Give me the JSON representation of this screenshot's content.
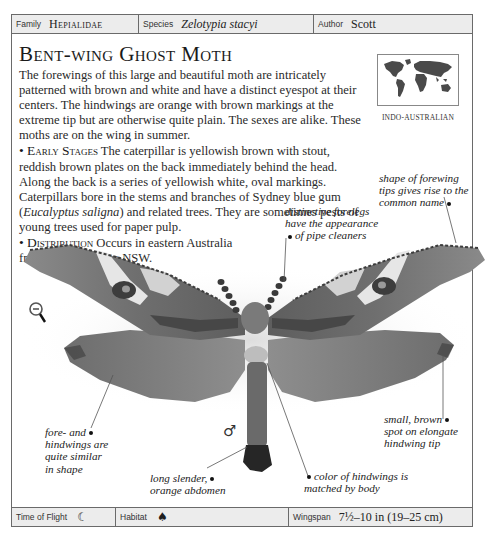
{
  "header": {
    "family_label": "Family",
    "family_value": "Hepialidae",
    "species_label": "Species",
    "species_value": "Zelotypia stacyi",
    "author_label": "Author",
    "author_value": "Scott"
  },
  "title": "Bent-wing Ghost Moth",
  "description": "The forewings of this large and beautiful moth are intricately patterned with brown and white and have a distinct eyespot at their centers. The hindwings are orange with brown markings at the extreme tip but are otherwise quite plain. The sexes are alike. These moths are on the wing in summer.",
  "early_stages": {
    "heading": "Early Stages",
    "text_before": "The caterpillar is yellowish brown with stout, reddish brown plates on the back immediately behind the head. Along the back is a series of yellowish white, oval markings. Caterpillars bore in the stems and branches of Sydney blue gum (",
    "italic": "Eucalyptus saligna",
    "text_after": ") and related trees. They are sometimes pests of young trees used for paper pulp."
  },
  "distribution": {
    "heading": "Distribution",
    "text": "Occurs in eastern Australia from Queensland to NSW."
  },
  "map": {
    "region": "Indo-Australian",
    "icon": "world-map-icon"
  },
  "annotations": {
    "forelegs": [
      "distinctive forelegs",
      "have the appearance",
      "of pipe cleaners"
    ],
    "forewing_tips": [
      "shape of forewing",
      "tips gives rise to the",
      "common name"
    ],
    "wings_similar": [
      "fore- and",
      "hindwings are",
      "quite similar",
      "in shape"
    ],
    "hindwing_spot": [
      "small, brown",
      "spot on elongate",
      "hindwing tip"
    ],
    "abdomen": [
      "long slender,",
      "orange abdomen"
    ],
    "body_color": [
      "color of hindwings is",
      "matched by body"
    ]
  },
  "symbols": {
    "sex": "♂",
    "zoom_icon": "zoom-out-icon"
  },
  "footer": {
    "time_label": "Time of Flight",
    "time_icon": "☾",
    "habitat_label": "Habitat",
    "habitat_icon": "♠",
    "wingspan_label": "Wingspan",
    "wingspan_value": "7½–10 in (19–25 cm)"
  },
  "colors": {
    "border": "#6a6a6a",
    "bar_bg": "#ececec",
    "text": "#2a2a2a"
  }
}
